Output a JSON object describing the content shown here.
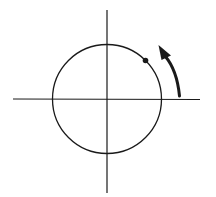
{
  "diagram": {
    "colors": {
      "background": "#ffffff",
      "stroke": "#1a1a1a"
    },
    "axes": {
      "horizontal": {
        "x1": 13,
        "y": 99,
        "x2": 200
      },
      "vertical": {
        "x": 107,
        "y1": 10,
        "y2": 193
      }
    },
    "circle": {
      "cx": 107,
      "cy": 99,
      "r": 54.5
    },
    "point": {
      "cx": 145.5,
      "cy": 60.5,
      "r": 2.8
    },
    "rotation_arrow": {
      "direction": "counterclockwise",
      "from": [
        179,
        96
      ],
      "to": [
        161,
        50
      ]
    }
  }
}
